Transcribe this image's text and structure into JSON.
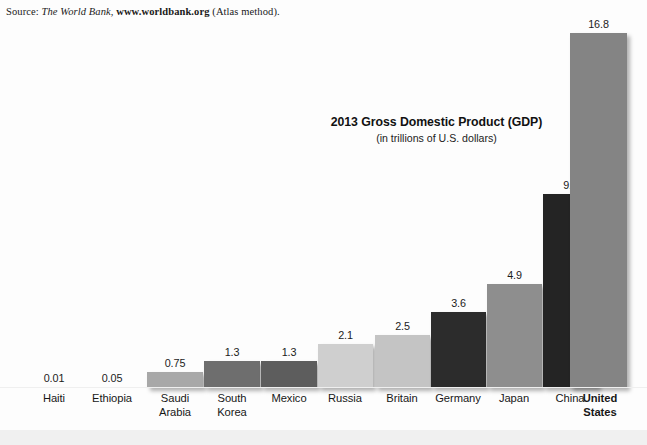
{
  "source_note": {
    "label": "Source:",
    "publisher": "The World Bank,",
    "url": "www.worldbank.org",
    "method": "(Atlas method)."
  },
  "chart_data": {
    "type": "bar",
    "title": "2013 Gross Domestic Product (GDP)",
    "subtitle": "(in trillions of U.S. dollars)",
    "xlabel": "",
    "ylabel": "",
    "ylim": [
      0,
      16.8
    ],
    "grid": false,
    "legend": null,
    "categories": [
      "Haiti",
      "Ethiopia",
      "Saudi Arabia",
      "South Korea",
      "Mexico",
      "Russia",
      "Britain",
      "Germany",
      "Japan",
      "China",
      "United States"
    ],
    "category_lines": [
      [
        "Haiti"
      ],
      [
        "Ethiopia"
      ],
      [
        "Saudi",
        "Arabia"
      ],
      [
        "South",
        "Korea"
      ],
      [
        "Mexico"
      ],
      [
        "Russia"
      ],
      [
        "Britain"
      ],
      [
        "Germany"
      ],
      [
        "Japan"
      ],
      [
        "China"
      ],
      [
        "United",
        "States"
      ]
    ],
    "values": [
      0.01,
      0.05,
      0.75,
      1.3,
      1.3,
      2.1,
      2.5,
      3.6,
      4.9,
      9.2,
      16.8
    ],
    "value_labels": [
      "0.01",
      "0.05",
      "0.75",
      "1.3",
      "1.3",
      "2.1",
      "2.5",
      "3.6",
      "4.9",
      "9.2",
      "16.8"
    ],
    "bar_colors": [
      "#c9c9c9",
      "#c9c9c9",
      "#a8a8a8",
      "#6e6e6e",
      "#5d5d5d",
      "#cfcfcf",
      "#c4c4c4",
      "#2c2c2c",
      "#8e8e8e",
      "#242424",
      "#848484"
    ],
    "emphasis_category": "United States"
  },
  "colors": {
    "background": "#fdfdfd",
    "text": "#171717",
    "baseline": "#efefef",
    "floor_band": "#f0f0f0"
  }
}
